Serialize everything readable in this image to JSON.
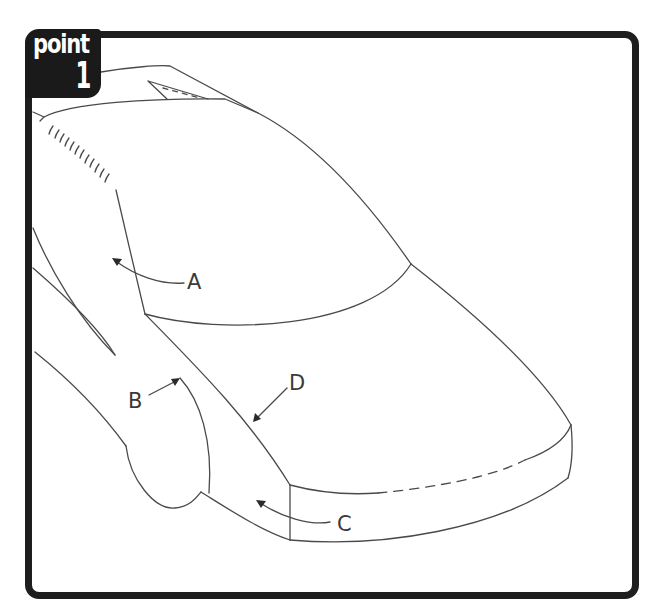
{
  "badge": {
    "word": "point",
    "number": "1"
  },
  "figure": {
    "labels": {
      "a": "A",
      "b": "B",
      "c": "C",
      "d": "D"
    }
  }
}
